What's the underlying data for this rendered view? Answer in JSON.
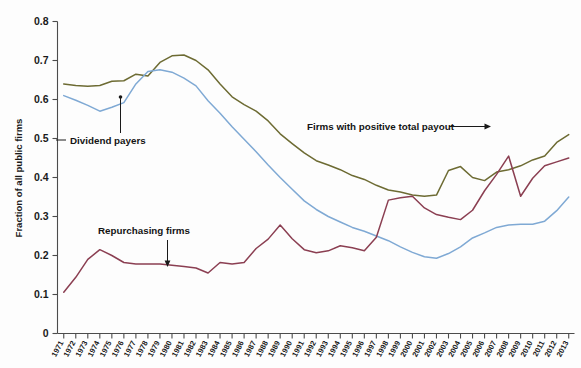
{
  "chart_data": {
    "type": "line",
    "title": "",
    "xlabel": "",
    "ylabel": "Fraction of all public firms",
    "ylim": [
      0,
      0.8
    ],
    "ytick_labels": [
      "0",
      "0.1",
      "0.2",
      "0.3",
      "0.4",
      "0.5",
      "0.6",
      "0.7",
      "0.8"
    ],
    "ytick_values": [
      0,
      0.1,
      0.2,
      0.3,
      0.4,
      0.5,
      0.6,
      0.7,
      0.8
    ],
    "grid": false,
    "legend_position": "inline-annotations",
    "x": [
      1971,
      1972,
      1973,
      1974,
      1975,
      1976,
      1977,
      1978,
      1979,
      1980,
      1981,
      1982,
      1983,
      1984,
      1985,
      1986,
      1987,
      1988,
      1989,
      1990,
      1991,
      1992,
      1993,
      1994,
      1995,
      1996,
      1997,
      1998,
      1999,
      2000,
      2001,
      2002,
      2003,
      2004,
      2005,
      2006,
      2007,
      2008,
      2009,
      2010,
      2011,
      2012,
      2013
    ],
    "categories": [
      "1971",
      "1972",
      "1973",
      "1974",
      "1975",
      "1976",
      "1977",
      "1978",
      "1979",
      "1980",
      "1981",
      "1982",
      "1983",
      "1984",
      "1985",
      "1986",
      "1987",
      "1988",
      "1989",
      "1990",
      "1991",
      "1992",
      "1993",
      "1994",
      "1995",
      "1996",
      "1997",
      "1998",
      "1999",
      "2000",
      "2001",
      "2002",
      "2003",
      "2004",
      "2005",
      "2006",
      "2007",
      "2008",
      "2009",
      "2010",
      "2011",
      "2012",
      "2013"
    ],
    "series": [
      {
        "name": "Firms with positive total payout",
        "color": "#6d6b33",
        "values": [
          0.64,
          0.636,
          0.634,
          0.636,
          0.647,
          0.648,
          0.665,
          0.66,
          0.695,
          0.712,
          0.714,
          0.7,
          0.676,
          0.64,
          0.607,
          0.587,
          0.57,
          0.545,
          0.512,
          0.487,
          0.463,
          0.443,
          0.432,
          0.42,
          0.405,
          0.395,
          0.38,
          0.368,
          0.363,
          0.355,
          0.352,
          0.355,
          0.418,
          0.428,
          0.4,
          0.392,
          0.414,
          0.42,
          0.43,
          0.445,
          0.455,
          0.49,
          0.51
        ]
      },
      {
        "name": "Dividend payers",
        "color": "#7fa9d4",
        "values": [
          0.61,
          0.598,
          0.585,
          0.57,
          0.58,
          0.592,
          0.64,
          0.672,
          0.676,
          0.67,
          0.655,
          0.635,
          0.597,
          0.565,
          0.53,
          0.498,
          0.466,
          0.432,
          0.4,
          0.37,
          0.34,
          0.318,
          0.3,
          0.286,
          0.272,
          0.262,
          0.25,
          0.238,
          0.222,
          0.208,
          0.197,
          0.193,
          0.205,
          0.222,
          0.245,
          0.258,
          0.272,
          0.278,
          0.28,
          0.28,
          0.288,
          0.315,
          0.35
        ]
      },
      {
        "name": "Repurchasing firms",
        "color": "#8b3f52",
        "values": [
          0.106,
          0.144,
          0.19,
          0.215,
          0.2,
          0.182,
          0.178,
          0.178,
          0.178,
          0.175,
          0.172,
          0.168,
          0.155,
          0.182,
          0.178,
          0.182,
          0.218,
          0.242,
          0.278,
          0.243,
          0.215,
          0.207,
          0.212,
          0.225,
          0.22,
          0.212,
          0.247,
          0.342,
          0.348,
          0.352,
          0.322,
          0.305,
          0.298,
          0.292,
          0.316,
          0.366,
          0.408,
          0.455,
          0.352,
          0.398,
          0.43,
          0.44,
          0.45
        ]
      }
    ],
    "annotations": [
      {
        "name": "dividend-payers",
        "text": "Dividend payers",
        "pointer": "vertical-up"
      },
      {
        "name": "repurchasing-firms",
        "text": "Repurchasing firms",
        "pointer": "arrow-down"
      },
      {
        "name": "firms-positive-total-payout",
        "text": "Firms with positive total payout",
        "pointer": "arrow-right"
      }
    ]
  },
  "colors": {
    "positive_payout": "#6d6b33",
    "dividend_payers": "#7fa9d4",
    "repurchasing_firms": "#8b3f52",
    "axis": "#4c4c4c",
    "text": "#1a1a1a",
    "background": "#fdfdfd"
  },
  "axis": {
    "y_title": "Fraction of all public firms"
  }
}
